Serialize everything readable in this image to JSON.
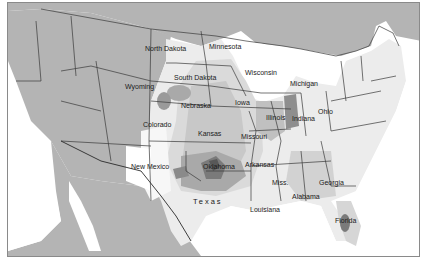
{
  "map": {
    "type": "choropleth-contour",
    "region": "Contiguous United States",
    "colors": {
      "foreign_land": "#b4b4b4",
      "water": "#ffffff",
      "level_0": "#f4f4f4",
      "level_1": "#e2e2e2",
      "level_2": "#cbcbcb",
      "level_3": "#a9a9a9",
      "level_4": "#8a8a8a",
      "level_5": "#6a6a6a",
      "border": "#3a3a3a"
    },
    "labels": {
      "north_dakota": "North Dakota",
      "minnesota": "Minnesota",
      "south_dakota": "South Dakota",
      "wisconsin": "Wisconsin",
      "michigan": "Michigan",
      "wyoming": "Wyoming",
      "nebraska": "Nebraska",
      "iowa": "Iowa",
      "illinois": "Illinois",
      "indiana": "Indiana",
      "ohio": "Ohio",
      "colorado": "Colorado",
      "kansas": "Kansas",
      "missouri": "Missouri",
      "new_mexico": "New Mexico",
      "oklahoma": "Oklahoma",
      "arkansas": "Arkansas",
      "texas": "Texas",
      "miss": "Miss.",
      "alabama": "Alabama",
      "georgia": "Georgia",
      "louisiana": "Louisiana",
      "florida": "Florida"
    }
  }
}
